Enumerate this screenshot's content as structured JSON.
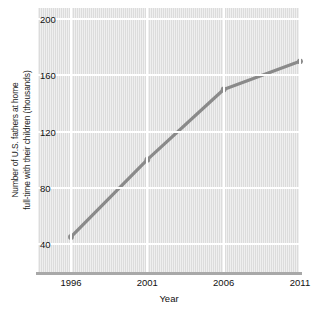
{
  "chart_data": {
    "type": "line",
    "title": "",
    "xlabel": "Year",
    "ylabel_line1": "Number of U.S. fathers at home",
    "ylabel_line2": "full-time with their children (thousands)",
    "x": [
      1996,
      2001,
      2006,
      2011
    ],
    "xtick_labels": [
      "1996",
      "2001",
      "2006",
      "2011"
    ],
    "ytick_labels": [
      "200",
      "160",
      "120",
      "80",
      "40"
    ],
    "yticks": [
      200,
      160,
      120,
      80,
      40
    ],
    "values": [
      45,
      100,
      150,
      170
    ],
    "series": [
      {
        "name": "Fathers at home full-time",
        "values": [
          45,
          100,
          150,
          170
        ]
      }
    ],
    "xlim": [
      1996,
      2011
    ],
    "ylim": [
      20,
      208
    ],
    "grid": "both",
    "legend": "none",
    "line_color": "#8a8a8a",
    "marker_color": "#8a8a8a",
    "plot_background": "#dcdcdc",
    "gridline_color": "#ffffff",
    "axis_color": "#a8a8a8"
  }
}
